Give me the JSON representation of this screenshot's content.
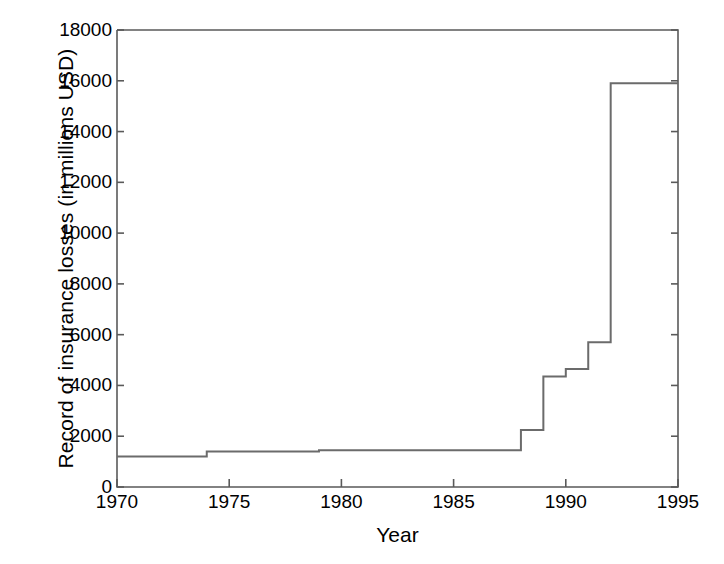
{
  "chart_data": {
    "type": "line",
    "subtype": "step",
    "title": "",
    "xlabel": "Year",
    "ylabel": "Record of insurance losses (in millions USD)",
    "xlim": [
      1970,
      1995
    ],
    "ylim": [
      0,
      18000
    ],
    "grid": false,
    "legend": null,
    "xticks": [
      1970,
      1975,
      1980,
      1985,
      1990,
      1995
    ],
    "xtick_labels": [
      "1970",
      "1975",
      "1980",
      "1985",
      "1990",
      "1995"
    ],
    "yticks": [
      0,
      2000,
      4000,
      6000,
      8000,
      10000,
      12000,
      14000,
      16000,
      18000
    ],
    "ytick_labels": [
      "0",
      "2000",
      "4000",
      "6000",
      "8000",
      "10000",
      "12000",
      "14000",
      "16000",
      "18000"
    ],
    "line_color": "#6b6b6b",
    "line_width": 2,
    "x": [
      1970,
      1974,
      1979,
      1988,
      1989,
      1990,
      1991,
      1992,
      1995
    ],
    "values": [
      1200,
      1400,
      1450,
      2250,
      4350,
      4650,
      5700,
      15900,
      15900
    ],
    "steps": [
      {
        "year_start": 1970,
        "year_end": 1974,
        "value": 1200
      },
      {
        "year_start": 1974,
        "year_end": 1979,
        "value": 1400
      },
      {
        "year_start": 1979,
        "year_end": 1988,
        "value": 1450
      },
      {
        "year_start": 1988,
        "year_end": 1989,
        "value": 2250
      },
      {
        "year_start": 1989,
        "year_end": 1990,
        "value": 4350
      },
      {
        "year_start": 1990,
        "year_end": 1991,
        "value": 4650
      },
      {
        "year_start": 1991,
        "year_end": 1992,
        "value": 5700
      },
      {
        "year_start": 1992,
        "year_end": 1995,
        "value": 15900
      }
    ]
  }
}
